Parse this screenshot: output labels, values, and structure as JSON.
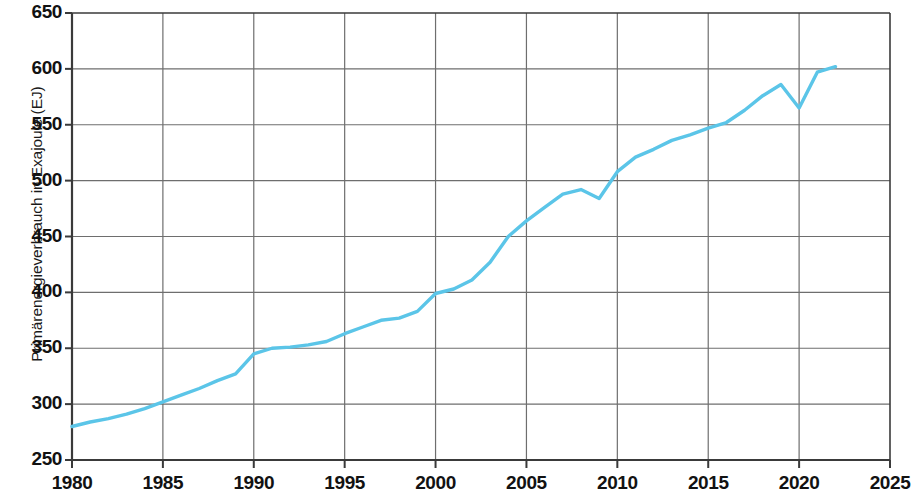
{
  "chart_data": {
    "type": "line",
    "title": "",
    "subtitle": "",
    "xlabel": "",
    "ylabel": "Primärenergieverbrauch in Exajoule (EJ)",
    "xlim": [
      1980,
      2025
    ],
    "ylim": [
      250,
      650
    ],
    "grid": true,
    "legend": null,
    "line_color": "#5BC5E8",
    "axis_color": "#3a3a3a",
    "grid_color": "#6e6e6e",
    "x_ticks": [
      1980,
      1985,
      1990,
      1995,
      2000,
      2005,
      2010,
      2015,
      2020,
      2025
    ],
    "x_tick_labels": [
      "1980",
      "1985",
      "1990",
      "1995",
      "2000",
      "2005",
      "2010",
      "2015",
      "2020",
      "2025"
    ],
    "y_ticks": [
      250,
      300,
      350,
      400,
      450,
      500,
      550,
      600,
      650
    ],
    "y_tick_labels": [
      "250",
      "300",
      "350",
      "400",
      "450",
      "500",
      "550",
      "600",
      "650"
    ],
    "series": [
      {
        "name": "Primärenergieverbrauch",
        "x": [
          1980,
          1981,
          1982,
          1983,
          1984,
          1985,
          1986,
          1987,
          1988,
          1989,
          1990,
          1991,
          1992,
          1993,
          1994,
          1995,
          1996,
          1997,
          1998,
          1999,
          2000,
          2001,
          2002,
          2003,
          2004,
          2005,
          2006,
          2007,
          2008,
          2009,
          2010,
          2011,
          2012,
          2013,
          2014,
          2015,
          2016,
          2017,
          2018,
          2019,
          2020,
          2021,
          2022
        ],
        "values": [
          280,
          284,
          287,
          291,
          296,
          302,
          308,
          314,
          321,
          327,
          345,
          350,
          351,
          353,
          356,
          363,
          369,
          375,
          377,
          383,
          399,
          403,
          411,
          427,
          450,
          464,
          476,
          488,
          492,
          484,
          508,
          521,
          528,
          536,
          541,
          547,
          552,
          563,
          576,
          586,
          565,
          597,
          602
        ]
      }
    ]
  },
  "axis": {
    "y_title": "Primärenergieverbrauch in Exajoule (EJ)"
  }
}
